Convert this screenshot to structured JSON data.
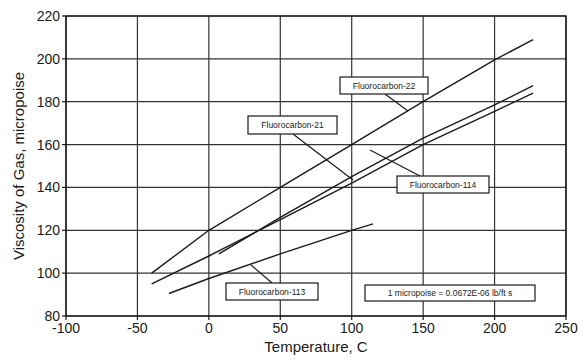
{
  "chart_data": {
    "type": "line",
    "title": "",
    "xlabel": "Temperature, C",
    "ylabel": "Viscosity of Gas, micropoise",
    "xlim": [
      -100,
      250
    ],
    "ylim": [
      80,
      220
    ],
    "xticks": [
      -100,
      -50,
      0,
      50,
      100,
      150,
      200,
      250
    ],
    "yticks": [
      80,
      100,
      120,
      140,
      160,
      180,
      200,
      220
    ],
    "grid": true,
    "legend": "inline labeled boxes with leader lines",
    "series": [
      {
        "name": "Fluorocarbon-22",
        "x": [
          -40,
          0,
          50,
          100,
          150,
          200,
          227
        ],
        "y": [
          100,
          120,
          140,
          160,
          180,
          199.5,
          209
        ]
      },
      {
        "name": "Fluorocarbon-21",
        "x": [
          7,
          50,
          100,
          150,
          200,
          227
        ],
        "y": [
          109,
          126,
          145,
          163,
          178.5,
          187.5
        ]
      },
      {
        "name": "Fluorocarbon-114",
        "x": [
          -40,
          0,
          50,
          100,
          150,
          200,
          227
        ],
        "y": [
          95,
          108,
          125,
          142,
          160,
          175.5,
          184
        ]
      },
      {
        "name": "Fluorocarbon-113",
        "x": [
          -28,
          0,
          50,
          100,
          115
        ],
        "y": [
          90.5,
          97.5,
          109,
          120,
          123
        ]
      }
    ],
    "annotations": [
      {
        "text": "Fluorocarbon-22",
        "box": [
          340,
          77,
          88,
          17
        ],
        "leader": [
          385,
          94,
          408,
          111
        ]
      },
      {
        "text": "Fluorocarbon-21",
        "box": [
          248,
          116,
          89,
          18
        ],
        "leader": [
          293,
          134,
          353,
          180
        ]
      },
      {
        "text": "Fluorocarbon-114",
        "box": [
          397,
          176,
          92,
          17
        ],
        "leader": [
          420,
          176,
          370,
          150
        ]
      },
      {
        "text": "Fluorocarbon-113",
        "box": [
          226,
          283,
          92,
          17
        ],
        "leader": [
          272,
          283,
          251,
          265
        ]
      },
      {
        "text": "1 micropoise = 0.0672E-06 lb/ft s",
        "box": [
          365,
          285,
          170,
          16
        ],
        "leader": null
      }
    ]
  },
  "colors": {
    "line": "#1a1a1a",
    "grid": "#333333",
    "background": "#ffffff"
  }
}
